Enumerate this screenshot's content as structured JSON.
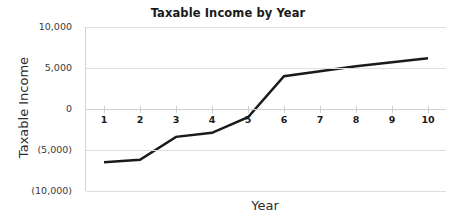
{
  "chart_data": {
    "type": "line",
    "title": "Taxable Income by Year",
    "xlabel": "Year",
    "ylabel": "Taxable Income",
    "categories": [
      "1",
      "2",
      "3",
      "4",
      "5",
      "6",
      "7",
      "8",
      "9",
      "10"
    ],
    "values": [
      -6500,
      -6200,
      -3400,
      -2900,
      -1000,
      4000,
      4600,
      5200,
      5700,
      6200
    ],
    "series": [
      {
        "name": "Taxable Income",
        "values": [
          -6500,
          -6200,
          -3400,
          -2900,
          -1000,
          4000,
          4600,
          5200,
          5700,
          6200
        ],
        "color": "#1a1a1a"
      }
    ],
    "ylim": [
      -10000,
      10000
    ],
    "ytick_values": [
      10000,
      5000,
      0,
      -5000,
      -10000
    ],
    "ytick_labels": [
      "10,000",
      "5,000",
      "0",
      "(5,000)",
      "(10,000)"
    ],
    "xtick_labels": [
      "1",
      "2",
      "3",
      "4",
      "5",
      "6",
      "7",
      "8",
      "9",
      "10"
    ],
    "grid": true,
    "grid_axis": "y",
    "legend": false,
    "legend_position": "none",
    "markers": false,
    "line_width": 2.5,
    "colors": {
      "line": "#1a1a1a",
      "grid": "#dedede",
      "axis": "#d4d4d4",
      "text": "#2b2b2b",
      "background": "#ffffff"
    }
  }
}
